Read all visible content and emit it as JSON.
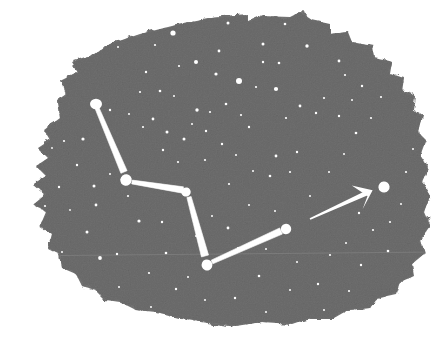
{
  "figure": {
    "medium": "printed halftone illustration on torn dark ground",
    "width": 447,
    "height": 345
  },
  "colors": {
    "page_background": "#ffffff",
    "sky_background": "#6e6e6e",
    "sky_background_dark": "#636363",
    "sky_background_light": "#7a7a7a",
    "star_fill": "#ffffff",
    "line_fill": "#ffffff",
    "arrow_fill": "#ffffff",
    "seam_line": "#8c8c8c"
  },
  "chart_data": {
    "type": "scatter",
    "xlabel": "",
    "ylabel": "",
    "xlim": [
      0,
      447
    ],
    "ylim": [
      0,
      345
    ],
    "grid": false,
    "legend": "none",
    "annotations": [
      {
        "name": "pointer-arrow",
        "from": [
          310,
          219
        ],
        "to": [
          369,
          192
        ],
        "note": "pointer line from the dipper bowl stars to Polaris"
      }
    ],
    "series": [
      {
        "name": "named-constellation-stars",
        "points": [
          {
            "label": "handle-end",
            "x": 96,
            "y": 104,
            "r": 6.0
          },
          {
            "label": "handle-bend",
            "x": 126,
            "y": 180,
            "r": 5.6
          },
          {
            "label": "bowl-top-right",
            "x": 186,
            "y": 192,
            "r": 4.6
          },
          {
            "label": "bowl-bottom-left",
            "x": 207,
            "y": 265,
            "r": 5.4
          },
          {
            "label": "pointer-star",
            "x": 286,
            "y": 229,
            "r": 5.2
          },
          {
            "label": "polaris",
            "x": 384,
            "y": 187,
            "r": 5.6
          }
        ]
      },
      {
        "name": "constellation-links",
        "links": [
          {
            "from": [
              97,
              108
            ],
            "to": [
              124,
              172
            ],
            "width": 4.2
          },
          {
            "from": [
              132,
              182
            ],
            "to": [
              183,
              190
            ],
            "width": 4.0
          },
          {
            "from": [
              189,
              197
            ],
            "to": [
              205,
              256
            ],
            "width": 4.6
          },
          {
            "from": [
              212,
              262
            ],
            "to": [
              281,
              231
            ],
            "width": 4.2
          }
        ]
      },
      {
        "name": "background-stars",
        "points": [
          {
            "x": 173,
            "y": 33,
            "r": 2.6
          },
          {
            "x": 228,
            "y": 23,
            "r": 1.5
          },
          {
            "x": 219,
            "y": 51,
            "r": 1.4
          },
          {
            "x": 155,
            "y": 45,
            "r": 1.1
          },
          {
            "x": 196,
            "y": 62,
            "r": 2.0
          },
          {
            "x": 179,
            "y": 66,
            "r": 1.1
          },
          {
            "x": 216,
            "y": 74,
            "r": 1.6
          },
          {
            "x": 263,
            "y": 44,
            "r": 1.5
          },
          {
            "x": 263,
            "y": 62,
            "r": 1.2
          },
          {
            "x": 279,
            "y": 63,
            "r": 1.3
          },
          {
            "x": 239,
            "y": 81,
            "r": 3.0
          },
          {
            "x": 256,
            "y": 87,
            "r": 1.1
          },
          {
            "x": 276,
            "y": 89,
            "r": 2.1
          },
          {
            "x": 307,
            "y": 46,
            "r": 1.7
          },
          {
            "x": 339,
            "y": 61,
            "r": 1.4
          },
          {
            "x": 345,
            "y": 75,
            "r": 1.1
          },
          {
            "x": 285,
            "y": 24,
            "r": 1.3
          },
          {
            "x": 118,
            "y": 47,
            "r": 1.0
          },
          {
            "x": 146,
            "y": 72,
            "r": 1.2
          },
          {
            "x": 140,
            "y": 92,
            "r": 1.1
          },
          {
            "x": 160,
            "y": 91,
            "r": 1.3
          },
          {
            "x": 174,
            "y": 96,
            "r": 1.0
          },
          {
            "x": 129,
            "y": 114,
            "r": 1.0
          },
          {
            "x": 143,
            "y": 127,
            "r": 1.1
          },
          {
            "x": 153,
            "y": 119,
            "r": 1.4
          },
          {
            "x": 167,
            "y": 132,
            "r": 1.5
          },
          {
            "x": 184,
            "y": 139,
            "r": 1.5
          },
          {
            "x": 197,
            "y": 110,
            "r": 1.7
          },
          {
            "x": 192,
            "y": 124,
            "r": 1.0
          },
          {
            "x": 206,
            "y": 131,
            "r": 1.2
          },
          {
            "x": 210,
            "y": 112,
            "r": 1.1
          },
          {
            "x": 226,
            "y": 104,
            "r": 1.3
          },
          {
            "x": 241,
            "y": 115,
            "r": 1.1
          },
          {
            "x": 249,
            "y": 127,
            "r": 1.2
          },
          {
            "x": 222,
            "y": 144,
            "r": 1.2
          },
          {
            "x": 236,
            "y": 155,
            "r": 1.0
          },
          {
            "x": 205,
            "y": 160,
            "r": 1.1
          },
          {
            "x": 178,
            "y": 162,
            "r": 1.1
          },
          {
            "x": 163,
            "y": 150,
            "r": 1.2
          },
          {
            "x": 110,
            "y": 110,
            "r": 1.2
          },
          {
            "x": 83,
            "y": 139,
            "r": 1.6
          },
          {
            "x": 64,
            "y": 141,
            "r": 1.1
          },
          {
            "x": 52,
            "y": 148,
            "r": 0.9
          },
          {
            "x": 77,
            "y": 165,
            "r": 1.2
          },
          {
            "x": 94,
            "y": 186,
            "r": 1.5
          },
          {
            "x": 96,
            "y": 205,
            "r": 1.4
          },
          {
            "x": 87,
            "y": 232,
            "r": 1.5
          },
          {
            "x": 100,
            "y": 258,
            "r": 1.9
          },
          {
            "x": 117,
            "y": 254,
            "r": 1.2
          },
          {
            "x": 139,
            "y": 221,
            "r": 1.6
          },
          {
            "x": 162,
            "y": 222,
            "r": 1.2
          },
          {
            "x": 166,
            "y": 253,
            "r": 1.3
          },
          {
            "x": 149,
            "y": 273,
            "r": 1.1
          },
          {
            "x": 176,
            "y": 289,
            "r": 1.2
          },
          {
            "x": 188,
            "y": 277,
            "r": 1.0
          },
          {
            "x": 128,
            "y": 196,
            "r": 1.1
          },
          {
            "x": 110,
            "y": 174,
            "r": 1.0
          },
          {
            "x": 59,
            "y": 187,
            "r": 1.2
          },
          {
            "x": 45,
            "y": 206,
            "r": 1.1
          },
          {
            "x": 70,
            "y": 210,
            "r": 0.9
          },
          {
            "x": 62,
            "y": 252,
            "r": 1.0
          },
          {
            "x": 229,
            "y": 184,
            "r": 1.1
          },
          {
            "x": 249,
            "y": 205,
            "r": 1.0
          },
          {
            "x": 228,
            "y": 228,
            "r": 1.4
          },
          {
            "x": 238,
            "y": 248,
            "r": 1.1
          },
          {
            "x": 196,
            "y": 236,
            "r": 1.0
          },
          {
            "x": 212,
            "y": 216,
            "r": 1.0
          },
          {
            "x": 259,
            "y": 276,
            "r": 1.3
          },
          {
            "x": 235,
            "y": 298,
            "r": 1.2
          },
          {
            "x": 266,
            "y": 249,
            "r": 1.0
          },
          {
            "x": 276,
            "y": 156,
            "r": 1.4
          },
          {
            "x": 270,
            "y": 176,
            "r": 1.3
          },
          {
            "x": 290,
            "y": 172,
            "r": 1.1
          },
          {
            "x": 297,
            "y": 152,
            "r": 1.2
          },
          {
            "x": 286,
            "y": 118,
            "r": 1.1
          },
          {
            "x": 300,
            "y": 106,
            "r": 1.4
          },
          {
            "x": 316,
            "y": 113,
            "r": 1.2
          },
          {
            "x": 324,
            "y": 98,
            "r": 1.1
          },
          {
            "x": 339,
            "y": 116,
            "r": 1.2
          },
          {
            "x": 352,
            "y": 100,
            "r": 1.0
          },
          {
            "x": 356,
            "y": 133,
            "r": 1.3
          },
          {
            "x": 371,
            "y": 118,
            "r": 1.1
          },
          {
            "x": 381,
            "y": 97,
            "r": 1.1
          },
          {
            "x": 362,
            "y": 86,
            "r": 1.2
          },
          {
            "x": 344,
            "y": 154,
            "r": 1.0
          },
          {
            "x": 329,
            "y": 172,
            "r": 1.0
          },
          {
            "x": 310,
            "y": 196,
            "r": 1.0
          },
          {
            "x": 359,
            "y": 213,
            "r": 1.2
          },
          {
            "x": 373,
            "y": 230,
            "r": 1.1
          },
          {
            "x": 346,
            "y": 243,
            "r": 1.0
          },
          {
            "x": 390,
            "y": 222,
            "r": 1.1
          },
          {
            "x": 401,
            "y": 204,
            "r": 1.0
          },
          {
            "x": 388,
            "y": 251,
            "r": 1.3
          },
          {
            "x": 361,
            "y": 265,
            "r": 1.2
          },
          {
            "x": 330,
            "y": 255,
            "r": 1.1
          },
          {
            "x": 318,
            "y": 284,
            "r": 1.2
          },
          {
            "x": 297,
            "y": 262,
            "r": 1.0
          },
          {
            "x": 290,
            "y": 290,
            "r": 1.0
          },
          {
            "x": 349,
            "y": 291,
            "r": 1.1
          },
          {
            "x": 324,
            "y": 310,
            "r": 1.0
          },
          {
            "x": 406,
            "y": 172,
            "r": 1.1
          },
          {
            "x": 413,
            "y": 149,
            "r": 1.0
          },
          {
            "x": 275,
            "y": 211,
            "r": 1.0
          },
          {
            "x": 253,
            "y": 171,
            "r": 1.0
          },
          {
            "x": 205,
            "y": 300,
            "r": 1.0
          },
          {
            "x": 266,
            "y": 312,
            "r": 1.0
          },
          {
            "x": 151,
            "y": 307,
            "r": 1.0
          },
          {
            "x": 119,
            "y": 287,
            "r": 1.0
          }
        ]
      }
    ]
  },
  "shapes": {
    "sky_outline": "M 60,118 L 58,100 L 66,94 L 62,80 L 78,72 L 72,62 L 92,56 L 110,44 L 140,34 L 176,25 L 212,18 L 248,15 L 248,22 L 262,16 L 290,17 L 300,12 L 312,20 L 330,24 L 330,34 L 348,32 L 352,42 L 372,46 L 374,58 L 392,62 L 390,74 L 404,78 L 402,92 L 414,96 L 412,110 L 422,116 L 418,132 L 426,140 L 420,156 L 428,168 L 422,182 L 430,196 L 424,212 L 430,226 L 420,240 L 424,254 L 412,264 L 414,276 L 400,282 L 396,294 L 378,298 L 370,308 L 348,310 L 334,318 L 310,318 L 292,324 L 262,322 L 236,326 L 206,322 L 180,318 L 156,312 L 136,310 L 120,302 L 106,300 L 96,290 L 82,286 L 76,274 L 62,268 L 60,254 L 48,248 L 52,234 L 40,226 L 46,212 L 34,204 L 46,194 L 34,184 L 46,176 L 36,166 L 48,158 L 38,148 L 50,140 L 44,130 Z"
  }
}
